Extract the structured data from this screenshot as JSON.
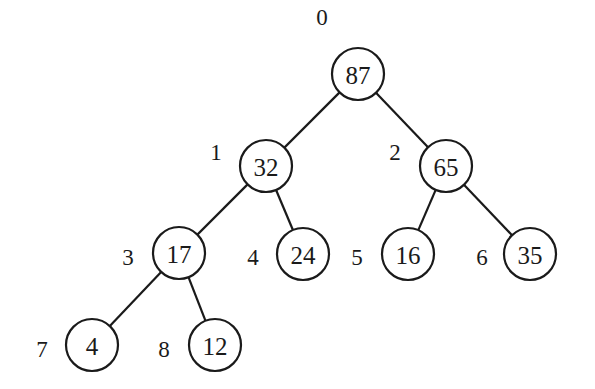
{
  "diagram": {
    "type": "binary-heap-tree",
    "stroke_color": "#1a1a1a",
    "background": "#ffffff",
    "nodes": [
      {
        "index": "0",
        "value": "87",
        "cx": 358,
        "cy": 74,
        "lx": 322,
        "ly": 17
      },
      {
        "index": "1",
        "value": "32",
        "cx": 266,
        "cy": 166,
        "lx": 216,
        "ly": 152
      },
      {
        "index": "2",
        "value": "65",
        "cx": 446,
        "cy": 166,
        "lx": 395,
        "ly": 152
      },
      {
        "index": "3",
        "value": "17",
        "cx": 179,
        "cy": 253,
        "lx": 128,
        "ly": 257
      },
      {
        "index": "4",
        "value": "24",
        "cx": 303,
        "cy": 254,
        "lx": 253,
        "ly": 257
      },
      {
        "index": "5",
        "value": "16",
        "cx": 408,
        "cy": 254,
        "lx": 357,
        "ly": 257
      },
      {
        "index": "6",
        "value": "35",
        "cx": 530,
        "cy": 254,
        "lx": 482,
        "ly": 257
      },
      {
        "index": "7",
        "value": "4",
        "cx": 92,
        "cy": 345,
        "lx": 42,
        "ly": 349
      },
      {
        "index": "8",
        "value": "12",
        "cx": 215,
        "cy": 345,
        "lx": 164,
        "ly": 349
      }
    ],
    "edges": [
      [
        0,
        1
      ],
      [
        0,
        2
      ],
      [
        1,
        3
      ],
      [
        1,
        4
      ],
      [
        2,
        5
      ],
      [
        2,
        6
      ],
      [
        3,
        7
      ],
      [
        3,
        8
      ]
    ],
    "radius": 26
  }
}
